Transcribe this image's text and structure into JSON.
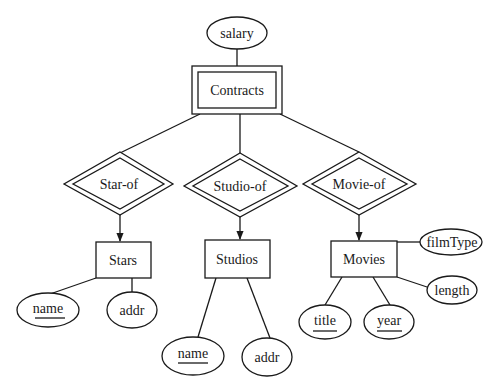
{
  "diagram": {
    "type": "entity-relationship",
    "weak_entity": {
      "label": "Contracts",
      "attribute": "salary"
    },
    "relationships": [
      {
        "label": "Star-of",
        "identifying": true,
        "to_entity": "Stars"
      },
      {
        "label": "Studio-of",
        "identifying": true,
        "to_entity": "Studios"
      },
      {
        "label": "Movie-of",
        "identifying": true,
        "to_entity": "Movies"
      }
    ],
    "entities": [
      {
        "label": "Stars",
        "attributes": [
          {
            "label": "name",
            "key": true
          },
          {
            "label": "addr",
            "key": false
          }
        ]
      },
      {
        "label": "Studios",
        "attributes": [
          {
            "label": "name",
            "key": true
          },
          {
            "label": "addr",
            "key": false
          }
        ]
      },
      {
        "label": "Movies",
        "attributes": [
          {
            "label": "title",
            "key": true
          },
          {
            "label": "year",
            "key": true
          },
          {
            "label": "filmType",
            "key": false
          },
          {
            "label": "length",
            "key": false
          }
        ]
      }
    ],
    "stroke_color": "#1a1a1a",
    "background": "#ffffff"
  }
}
